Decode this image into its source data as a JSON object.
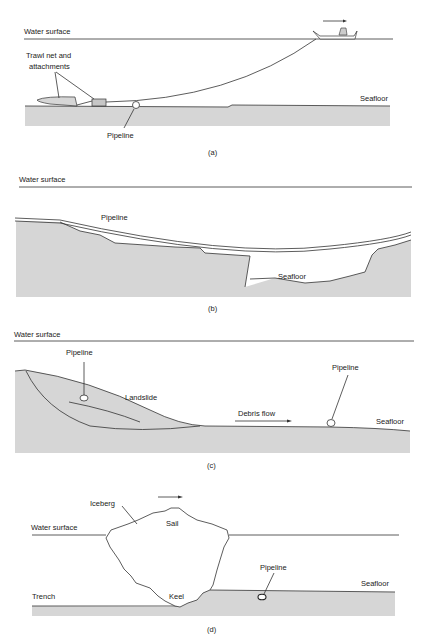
{
  "colors": {
    "seafloor_fill": "#d6d6d6",
    "line": "#333333",
    "background": "#ffffff"
  },
  "panels": {
    "a": {
      "caption": "(a)",
      "labels": {
        "water_surface": "Water surface",
        "trawl_line1": "Trawl net and",
        "trawl_line2": "attachments",
        "seafloor": "Seafloor",
        "pipeline": "Pipeline"
      }
    },
    "b": {
      "caption": "(b)",
      "labels": {
        "water_surface": "Water surface",
        "pipeline": "Pipeline",
        "seafloor": "Seafloor"
      }
    },
    "c": {
      "caption": "(c)",
      "labels": {
        "water_surface": "Water surface",
        "pipeline_left": "Pipeline",
        "landslide": "Landslide",
        "debris_flow": "Debris flow",
        "pipeline_right": "Pipeline",
        "seafloor": "Seafloor"
      }
    },
    "d": {
      "caption": "(d)",
      "labels": {
        "iceberg": "Iceberg",
        "sail": "Sail",
        "water_surface": "Water surface",
        "pipeline": "Pipeline",
        "seafloor": "Seafloor",
        "trench": "Trench",
        "keel": "Keel"
      }
    }
  }
}
